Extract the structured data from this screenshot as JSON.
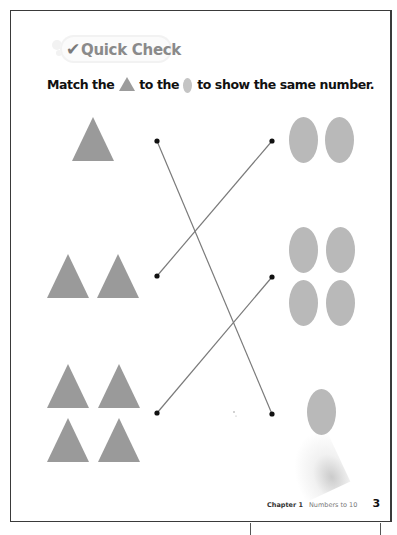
{
  "header": {
    "badge_check_icon": "✔",
    "badge_title": "Quick Check"
  },
  "instruction": {
    "part1": "Match the",
    "part2": "to the",
    "part3": "to show the same number.",
    "inline_icons": [
      "triangle-icon",
      "oval-icon"
    ]
  },
  "colors": {
    "triangle": "#9a9a9a",
    "oval": "#b9b9b9",
    "line": "#7a7a7a",
    "dot": "#111111",
    "border": "#3a3a3a"
  },
  "exercise": {
    "rows": [
      {
        "triangles": 1,
        "ovals": 2
      },
      {
        "triangles": 2,
        "ovals": 4
      },
      {
        "triangles": 4,
        "ovals": 1
      }
    ],
    "matches": [
      {
        "from_row": 1,
        "to_row": 3
      },
      {
        "from_row": 2,
        "to_row": 1
      },
      {
        "from_row": 3,
        "to_row": 2
      }
    ]
  },
  "footer": {
    "chapter": "Chapter 1",
    "topic": "Numbers to 10",
    "page_number": "3"
  }
}
